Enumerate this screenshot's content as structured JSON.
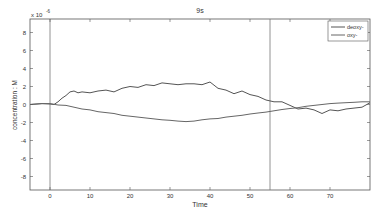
{
  "chart_data": {
    "type": "line",
    "title": "9s",
    "xlabel": "Time",
    "ylabel": "concentration : M",
    "y_exponent_label": "x 10",
    "y_exponent": "-6",
    "xlim": [
      -5,
      80
    ],
    "ylim": [
      -9.5,
      9.5
    ],
    "xticks": [
      0,
      10,
      20,
      30,
      40,
      50,
      60,
      70
    ],
    "yticks": [
      8,
      6,
      4,
      2,
      0,
      -2,
      -4,
      -6,
      -8
    ],
    "grid": false,
    "legend_position": "upper right",
    "vertical_markers": [
      0,
      55
    ],
    "series": [
      {
        "name": "deoxy-",
        "color": "#555555",
        "x": [
          -5,
          -2,
          0,
          1,
          2,
          3,
          4,
          5,
          6,
          7,
          8,
          10,
          12,
          14,
          16,
          18,
          20,
          22,
          24,
          26,
          28,
          30,
          32,
          34,
          36,
          38,
          40,
          42,
          44,
          46,
          48,
          50,
          52,
          54,
          55,
          56,
          58,
          60,
          62,
          64,
          66,
          68,
          70,
          72,
          74,
          76,
          78,
          80
        ],
        "y": [
          0.0,
          0.1,
          0.05,
          0.0,
          0.3,
          0.7,
          1.0,
          1.4,
          1.5,
          1.3,
          1.4,
          1.3,
          1.5,
          1.6,
          1.4,
          1.8,
          2.0,
          1.9,
          2.2,
          2.1,
          2.4,
          2.3,
          2.2,
          2.3,
          2.3,
          2.2,
          2.5,
          1.8,
          1.6,
          1.2,
          1.5,
          1.1,
          0.9,
          0.5,
          0.4,
          0.3,
          0.3,
          -0.1,
          -0.5,
          -0.4,
          -0.6,
          -1.0,
          -0.6,
          -0.7,
          -0.5,
          -0.4,
          -0.3,
          0.2
        ]
      },
      {
        "name": "oxy-",
        "color": "#666666",
        "x": [
          -5,
          -2,
          0,
          2,
          4,
          6,
          8,
          10,
          12,
          14,
          16,
          18,
          20,
          22,
          24,
          26,
          28,
          30,
          32,
          34,
          36,
          38,
          40,
          42,
          44,
          46,
          48,
          50,
          52,
          54,
          56,
          58,
          60,
          62,
          64,
          66,
          68,
          70,
          72,
          74,
          76,
          78,
          80
        ],
        "y": [
          0.0,
          0.1,
          0.1,
          -0.05,
          -0.1,
          -0.3,
          -0.5,
          -0.6,
          -0.8,
          -0.9,
          -1.0,
          -1.2,
          -1.3,
          -1.4,
          -1.5,
          -1.6,
          -1.7,
          -1.75,
          -1.85,
          -1.9,
          -1.85,
          -1.7,
          -1.6,
          -1.55,
          -1.4,
          -1.3,
          -1.2,
          -1.05,
          -0.95,
          -0.85,
          -0.7,
          -0.55,
          -0.45,
          -0.35,
          -0.2,
          -0.1,
          0.0,
          0.1,
          0.15,
          0.2,
          0.25,
          0.3,
          0.3
        ]
      }
    ]
  }
}
